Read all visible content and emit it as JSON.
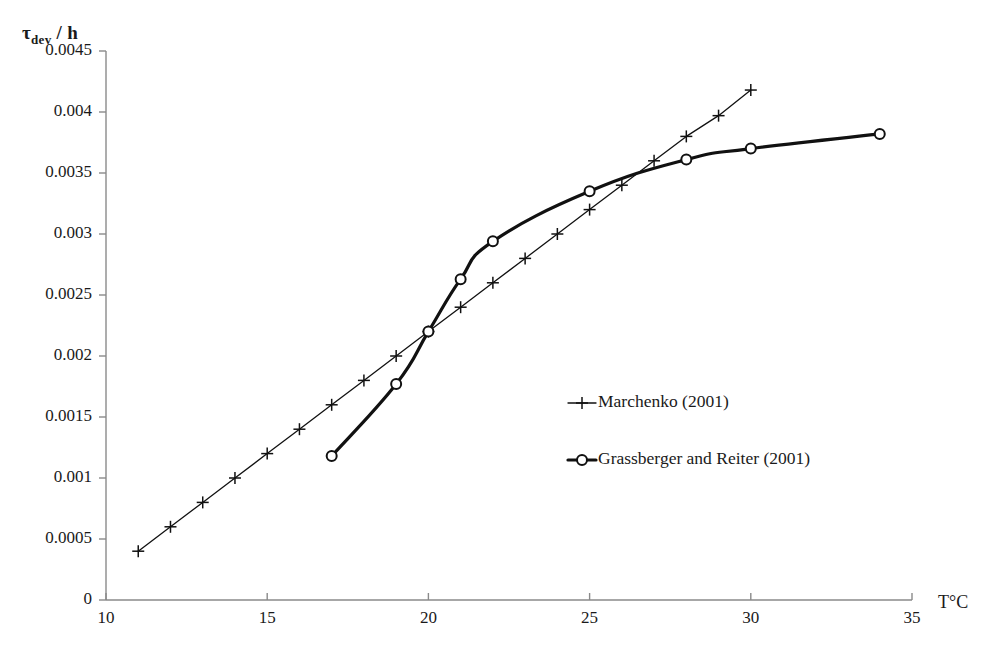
{
  "chart_data": {
    "type": "line",
    "title": "",
    "subtitle": "",
    "xlabel": "T°C",
    "ylabel_main": "τ",
    "ylabel_sub": "dev",
    "ylabel_tail": " / h",
    "ylabel_full": "τdev / h",
    "xlim": [
      10,
      35
    ],
    "ylim": [
      0,
      0.0045
    ],
    "grid": false,
    "legend_position": "center-right",
    "xticks": [
      10,
      15,
      20,
      25,
      30,
      35
    ],
    "xtick_labels": [
      "10",
      "15",
      "20",
      "25",
      "30",
      "35"
    ],
    "yticks": [
      0,
      0.0005,
      0.001,
      0.0015,
      0.002,
      0.0025,
      0.003,
      0.0035,
      0.004,
      0.0045
    ],
    "ytick_labels": [
      "0",
      "0.0005",
      "0.001",
      "0.0015",
      "0.002",
      "0.0025",
      "0.003",
      "0.0035",
      "0.004",
      "0.0045"
    ],
    "series": [
      {
        "name": "Marchenko (2001)",
        "marker": "plus",
        "line_width": 1.3,
        "color": "#111111",
        "x": [
          11,
          12,
          13,
          14,
          15,
          16,
          17,
          18,
          19,
          20,
          21,
          22,
          23,
          24,
          25,
          26,
          27,
          28,
          29,
          30
        ],
        "y": [
          0.0004,
          0.0006,
          0.0008,
          0.001,
          0.0012,
          0.0014,
          0.0016,
          0.0018,
          0.002,
          0.0022,
          0.0024,
          0.0026,
          0.0028,
          0.003,
          0.0032,
          0.0034,
          0.0036,
          0.0038,
          0.00397,
          0.00418
        ]
      },
      {
        "name": "Grassberger and Reiter (2001)",
        "marker": "circle",
        "line_width": 3.2,
        "color": "#111111",
        "x": [
          17,
          19,
          20,
          21,
          22,
          25,
          28,
          30,
          34
        ],
        "y": [
          0.00118,
          0.00177,
          0.0022,
          0.00263,
          0.00294,
          0.00335,
          0.00361,
          0.0037,
          0.00382
        ]
      }
    ]
  },
  "legend": {
    "items": [
      {
        "label": "Marchenko (2001)",
        "marker": "plus"
      },
      {
        "label": "Grassberger and Reiter (2001)",
        "marker": "circle"
      }
    ]
  },
  "colors": {
    "axis": "#8a8a8a",
    "ink": "#111111",
    "background": "#ffffff"
  }
}
